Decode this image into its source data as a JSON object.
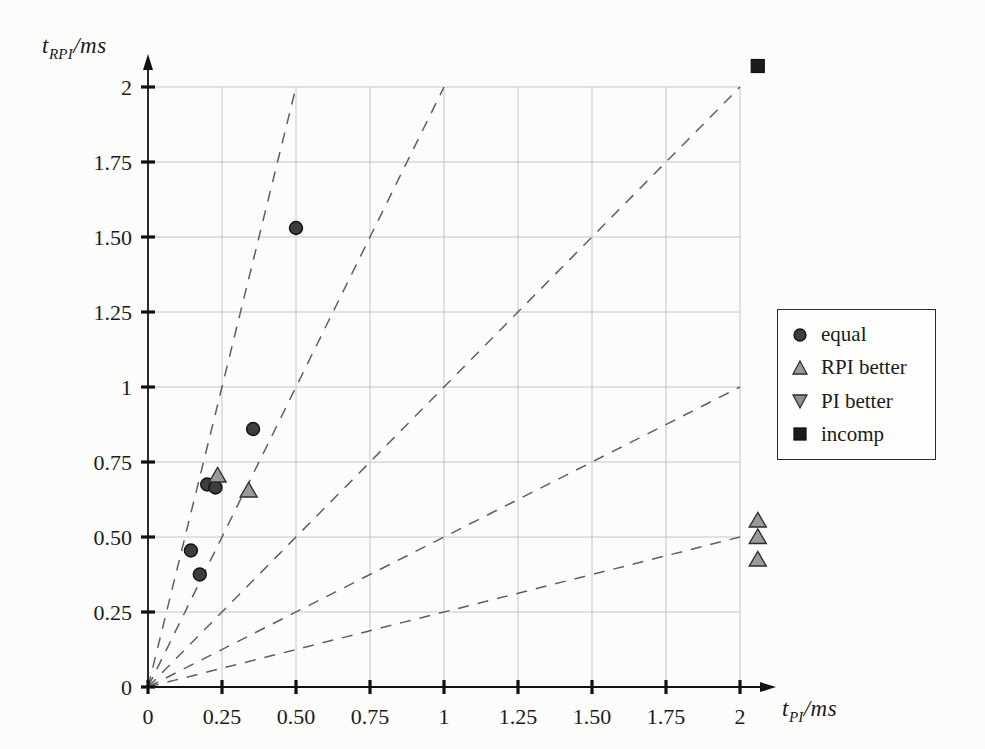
{
  "figure": {
    "background_color": "#fcfcfb",
    "axis_color": "#111111",
    "grid_color": "#bfbfbf",
    "tick_label_color": "#1b1b1b"
  },
  "chart_data": {
    "type": "scatter",
    "title": "",
    "xlabel": {
      "var": "t",
      "sub": "PI",
      "unit": "/ms"
    },
    "ylabel": {
      "var": "t",
      "sub": "RPI",
      "unit": "/ms"
    },
    "xlim": [
      0,
      2.12
    ],
    "ylim": [
      0,
      2.12
    ],
    "grid": true,
    "x_ticks": {
      "values": [
        0,
        0.25,
        0.5,
        0.75,
        1,
        1.25,
        1.5,
        1.75,
        2
      ],
      "labels": [
        "0",
        "0.25",
        "0.50",
        "0.75",
        "1",
        "1.25",
        "1.50",
        "1.75",
        "2"
      ]
    },
    "y_ticks": {
      "values": [
        0,
        0.25,
        0.5,
        0.75,
        1,
        1.25,
        1.5,
        1.75,
        2
      ],
      "labels": [
        "0",
        "0.25",
        "0.50",
        "0.75",
        "1",
        "1.25",
        "1.50",
        "1.75",
        "2"
      ]
    },
    "ratio_lines": {
      "style": "dashed",
      "color": "#5f5f5f",
      "slopes": [
        4,
        2,
        1,
        0.5,
        0.25
      ],
      "note": "dashed rays from origin to plot boundary"
    },
    "series": [
      {
        "name": "equal",
        "marker": "circle",
        "fill": "#3d3d3d",
        "edge": "#111111",
        "points": [
          [
            0.5,
            1.53
          ],
          [
            0.355,
            0.86
          ],
          [
            0.2,
            0.675
          ],
          [
            0.228,
            0.665
          ],
          [
            0.145,
            0.455
          ],
          [
            0.175,
            0.375
          ]
        ]
      },
      {
        "name": "RPI better",
        "marker": "triangle-up",
        "fill": "#9a9a9a",
        "edge": "#2e2e2e",
        "points": [
          [
            0.235,
            0.705
          ],
          [
            0.34,
            0.655
          ],
          [
            2.06,
            0.555
          ],
          [
            2.06,
            0.5
          ],
          [
            2.06,
            0.425
          ]
        ]
      },
      {
        "name": "PI better",
        "marker": "triangle-down",
        "fill": "#8f8f8f",
        "edge": "#2e2e2e",
        "points": []
      },
      {
        "name": "incomp",
        "marker": "square",
        "fill": "#1c1c1c",
        "edge": "#111111",
        "points": [
          [
            2.06,
            2.07
          ]
        ]
      }
    ],
    "legend": {
      "position": "right-outside",
      "items": [
        "equal",
        "RPI better",
        "PI better",
        "incomp"
      ]
    }
  }
}
